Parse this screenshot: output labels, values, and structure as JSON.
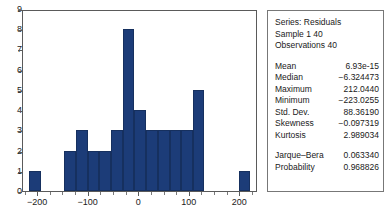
{
  "chart_data": {
    "type": "bar",
    "title": "",
    "xlabel": "",
    "ylabel": "",
    "xlim": [
      -230,
      235
    ],
    "ylim": [
      0,
      9
    ],
    "grid": false,
    "legend": null,
    "y_ticks": [
      "0",
      "1",
      "2",
      "3",
      "4",
      "5",
      "6",
      "7",
      "8",
      "9"
    ],
    "x_ticks": [
      "-200",
      "-100",
      "0",
      "100",
      "200"
    ],
    "bar_color": "#1c3c78",
    "bar_edge_color": "#16305f",
    "bins": [
      {
        "center": -205,
        "x0": -218,
        "x1": -195,
        "value": 1
      },
      {
        "center": -135,
        "x0": -148,
        "x1": -125,
        "value": 2
      },
      {
        "center": -112,
        "x0": -125,
        "x1": -102,
        "value": 3
      },
      {
        "center": -90,
        "x0": -102,
        "x1": -79,
        "value": 2
      },
      {
        "center": -67,
        "x0": -79,
        "x1": -56,
        "value": 2
      },
      {
        "center": -44,
        "x0": -56,
        "x1": -33,
        "value": 3
      },
      {
        "center": -21,
        "x0": -33,
        "x1": -10,
        "value": 8
      },
      {
        "center": 2,
        "x0": -10,
        "x1": 14,
        "value": 4
      },
      {
        "center": 25,
        "x0": 14,
        "x1": 37,
        "value": 3
      },
      {
        "center": 48,
        "x0": 37,
        "x1": 60,
        "value": 3
      },
      {
        "center": 71,
        "x0": 60,
        "x1": 83,
        "value": 3
      },
      {
        "center": 94,
        "x0": 83,
        "x1": 106,
        "value": 3
      },
      {
        "center": 117,
        "x0": 106,
        "x1": 129,
        "value": 5
      },
      {
        "center": 208,
        "x0": 197,
        "x1": 220,
        "value": 1
      }
    ]
  },
  "stats": {
    "series_line": "Series: Residuals",
    "sample_line": "Sample 1 40",
    "observations_line": "Observations 40",
    "rows": [
      {
        "label": "Mean",
        "value": "6.93e-15"
      },
      {
        "label": "Median",
        "value": "-6.324473"
      },
      {
        "label": "Maximum",
        "value": "212.0440"
      },
      {
        "label": "Minimum",
        "value": "-223.0255"
      },
      {
        "label": "Std. Dev.",
        "value": "88.36190"
      },
      {
        "label": "Skewness",
        "value": "-0.097319"
      },
      {
        "label": "Kurtosis",
        "value": "2.989034"
      }
    ],
    "test_rows": [
      {
        "label": "Jarque-Bera",
        "value": "0.063340"
      },
      {
        "label": "Probability",
        "value": "0.968826"
      }
    ]
  }
}
